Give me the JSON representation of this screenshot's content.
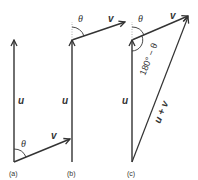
{
  "diagram": {
    "panels": [
      {
        "id": "a",
        "caption": "(a)",
        "u_label": "u",
        "v_label": "v",
        "angle_label": "θ"
      },
      {
        "id": "b",
        "caption": "(b)",
        "u_label": "u",
        "v_label": "v",
        "angle_label": "θ"
      },
      {
        "id": "c",
        "caption": "(c)",
        "u_label": "u",
        "v_label": "v",
        "angle_label": "θ",
        "supplement_label": "180° − θ",
        "sum_label": "u + v"
      }
    ],
    "colors": {
      "stroke": "#333333",
      "dotted": "#999999",
      "text": "#333333"
    }
  }
}
